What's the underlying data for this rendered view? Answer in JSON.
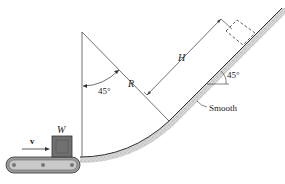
{
  "diagram": {
    "labels": {
      "velocity": "v",
      "weight": "W",
      "angle_left": "45°",
      "radius": "R",
      "height": "H",
      "angle_right": "45°",
      "surface": "Smooth"
    },
    "colors": {
      "line": "#333333",
      "ground": "#bdbdbd",
      "box": "#6f6f6f",
      "belt": "#8a8a8a"
    }
  }
}
